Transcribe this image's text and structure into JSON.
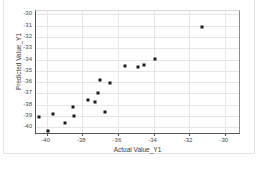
{
  "chart_data": {
    "type": "scatter",
    "title": "",
    "xlabel": "Actual Value_Y1",
    "ylabel": "Predicted Value_Y1",
    "xlim": [
      -40.6,
      -29.2
    ],
    "ylim": [
      -40.5,
      -29.7
    ],
    "xticks": [
      -40,
      -38,
      -36,
      -34,
      -32,
      -30
    ],
    "yticks": [
      -30,
      -31,
      -32,
      -33,
      -34,
      -35,
      -36,
      -37,
      -38,
      -39,
      -40
    ],
    "xtick_labels": [
      "-40",
      "-38",
      "-36",
      "-34",
      "-32",
      "-30"
    ],
    "ytick_labels": [
      "-30",
      "-31",
      "-32",
      "-33",
      "-34",
      "-35",
      "-36",
      "-37",
      "-38",
      "-39",
      "-40"
    ],
    "grid": true,
    "legend": false,
    "marker_color": "#1a1a1a",
    "marker_shape": "square",
    "points": [
      {
        "x": -40.45,
        "y": -39.1
      },
      {
        "x": -39.95,
        "y": -40.3
      },
      {
        "x": -39.65,
        "y": -38.8
      },
      {
        "x": -38.95,
        "y": -39.6
      },
      {
        "x": -38.55,
        "y": -38.2
      },
      {
        "x": -38.45,
        "y": -39.0
      },
      {
        "x": -37.7,
        "y": -37.55
      },
      {
        "x": -37.3,
        "y": -37.75
      },
      {
        "x": -37.1,
        "y": -37.0
      },
      {
        "x": -37.0,
        "y": -35.8
      },
      {
        "x": -36.75,
        "y": -38.6
      },
      {
        "x": -36.45,
        "y": -36.1
      },
      {
        "x": -35.6,
        "y": -34.55
      },
      {
        "x": -34.85,
        "y": -34.7
      },
      {
        "x": -34.55,
        "y": -34.45
      },
      {
        "x": -33.9,
        "y": -33.95
      },
      {
        "x": -31.3,
        "y": -31.15
      }
    ]
  },
  "axes": {
    "x_title": "Actual Value_Y1",
    "y_title": "Predicted Value_Y1"
  }
}
